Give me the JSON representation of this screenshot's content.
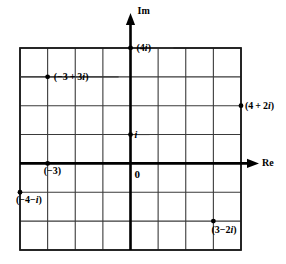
{
  "figure": {
    "kind": "complex-plane-diagram",
    "title": "",
    "axes": {
      "imaginary_axis_label": "Im",
      "real_axis_label": "Re",
      "origin_label": "0"
    },
    "grid": {
      "x_min": -4,
      "x_max": 4,
      "y_min": -3,
      "y_max": 4,
      "columns": 8,
      "rows": 7,
      "left_px": 20,
      "right_px": 241,
      "top_px": 48,
      "bottom_px": 250,
      "cell_w_px": 27.625,
      "cell_h_px": 28.857,
      "origin_x_px": 130.5,
      "origin_y_px": 163.4,
      "grid_color": "#3a3a3a",
      "axis_color": "#000000",
      "border_color": "#1a1a1a"
    },
    "points": [
      {
        "id": "p-4i",
        "label": "(4i)",
        "re": 0,
        "im": 4,
        "label_dx": 6,
        "label_dy": 0,
        "connector": "right"
      },
      {
        "id": "p-neg3plus3i",
        "label": "(-3+3i)",
        "re": -3,
        "im": 3,
        "label_dx": 6,
        "label_dy": 0,
        "connector": "both"
      },
      {
        "id": "p-4plus2i",
        "label": "(4+2i)",
        "re": 4,
        "im": 2,
        "label_dx": 4,
        "label_dy": 0,
        "connector": "none"
      },
      {
        "id": "p-i",
        "label": "i",
        "re": 0,
        "im": 1,
        "label_dx": 4,
        "label_dy": 0,
        "connector": "right"
      },
      {
        "id": "p-neg3",
        "label": "(-3)",
        "re": -3,
        "im": 0,
        "label_dx": -4,
        "label_dy": 8,
        "connector": "none"
      },
      {
        "id": "p-neg4minusi",
        "label": "(-4-i)",
        "re": -4,
        "im": -1,
        "label_dx": -4,
        "label_dy": 8,
        "connector": "none"
      },
      {
        "id": "p-3minus2i",
        "label": "(3-2i)",
        "re": 3,
        "im": -2,
        "label_dx": -2,
        "label_dy": 9,
        "connector": "none"
      }
    ],
    "point_labels": {
      "four_i": "(4i)",
      "neg_three_plus_three_i": "(-3+3i)",
      "four_plus_two_i": "(4+2i)",
      "i": "i",
      "neg_three": "(-3)",
      "neg_four_minus_i": "(-4-i)",
      "three_minus_two_i": "(3-2i)"
    }
  }
}
